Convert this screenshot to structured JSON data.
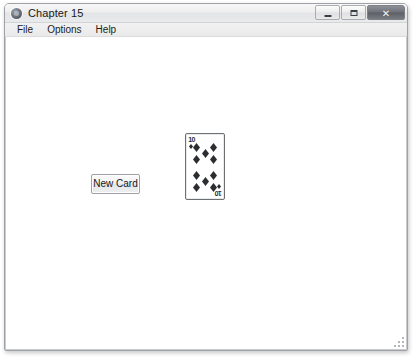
{
  "window": {
    "title": "Chapter 15",
    "icon": "app-icon",
    "controls": {
      "minimize_label": "Minimize",
      "maximize_label": "Maximize",
      "close_label": "✕"
    }
  },
  "menu": {
    "items": [
      {
        "label": "File"
      },
      {
        "label": "Options"
      },
      {
        "label": "Help"
      }
    ]
  },
  "main": {
    "new_card_button_label": "New Card",
    "card": {
      "rank": "10",
      "suit": "diamonds",
      "suit_symbol": "♦",
      "index_top_left": "10",
      "index_bottom_right": "10",
      "pip_count": 10,
      "color": "#2b2d30",
      "face_color": "#ffffff",
      "border_color": "#6d7073"
    }
  },
  "theme": {
    "window_background": "#f0f0f0",
    "client_background": "#ffffff",
    "frame_border": "#9fa3a8",
    "title_text": "#16191c",
    "menu_text": "#1b1e21",
    "close_button": "#6e7278"
  }
}
